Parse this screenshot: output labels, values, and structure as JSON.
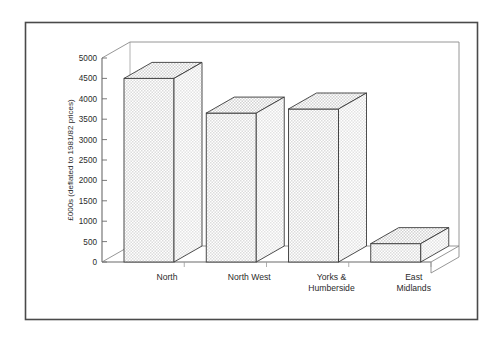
{
  "chart_data": {
    "type": "bar",
    "title": "",
    "subtitle": "",
    "xlabel": "",
    "ylabel": "£000s (deflated to 1981/82 prices)",
    "categories": [
      "North",
      "North West",
      "Yorks & Humberside",
      "East Midlands"
    ],
    "category_lines": [
      [
        "North"
      ],
      [
        "North West"
      ],
      [
        "Yorks &",
        "Humberside"
      ],
      [
        "East",
        "Midlands"
      ]
    ],
    "values": [
      4500,
      3650,
      3750,
      450
    ],
    "ylim": [
      0,
      5000
    ],
    "ytick_values": [
      0,
      500,
      1000,
      1500,
      2000,
      2500,
      3000,
      3500,
      4000,
      4500,
      5000
    ],
    "ytick_labels": [
      "0",
      "500",
      "1000",
      "1500",
      "2000",
      "2500",
      "3000",
      "3500",
      "4000",
      "4500",
      "5000"
    ],
    "grid": false,
    "legend": null,
    "legend_position": "none",
    "style": "3d-bar",
    "annotations": []
  },
  "figure": {
    "border_color": "#4a4a4a",
    "plot_line_color": "#6b6b6b",
    "bar_fill_color": "#e9e9e9",
    "bar_edge_color": "#3a3a3a",
    "bar_top_color": "#dedede",
    "bar_side_color": "#ededed",
    "background_color": "#ffffff",
    "text_color": "#2b2b2b"
  }
}
